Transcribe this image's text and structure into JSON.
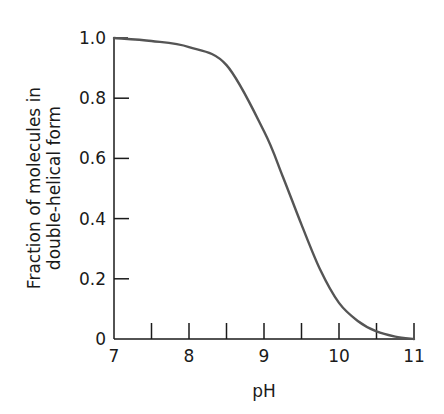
{
  "chart_data": {
    "type": "line",
    "title": "",
    "xlabel": "pH",
    "ylabel_lines": [
      "Fraction of molecules in",
      "double-helical form"
    ],
    "ylabel": "Fraction of molecules in double-helical form",
    "xlim": [
      7,
      11
    ],
    "ylim": [
      0,
      1.0
    ],
    "x_ticks_major": [
      7,
      8,
      9,
      10,
      11
    ],
    "x_tick_labels": [
      "7",
      "8",
      "9",
      "10",
      "11"
    ],
    "x_ticks_minor": [
      7.5,
      8,
      8.5,
      9,
      9.5,
      10,
      10.5,
      11
    ],
    "y_ticks": [
      0,
      0.2,
      0.4,
      0.6,
      0.8,
      1.0
    ],
    "y_tick_labels": [
      "0",
      "0.2",
      "0.4",
      "0.6",
      "0.8",
      "1.0"
    ],
    "grid": false,
    "legend": null,
    "series": [
      {
        "name": "double-helical fraction",
        "color": "#555555",
        "x": [
          7.0,
          7.5,
          8.0,
          8.5,
          9.0,
          9.25,
          9.5,
          9.75,
          10.0,
          10.25,
          10.5,
          10.75,
          11.0
        ],
        "y": [
          1.0,
          0.99,
          0.97,
          0.91,
          0.69,
          0.54,
          0.38,
          0.23,
          0.12,
          0.06,
          0.025,
          0.008,
          0.0
        ]
      }
    ]
  }
}
